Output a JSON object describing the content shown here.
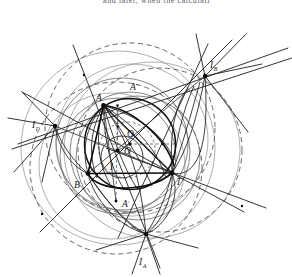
{
  "figure": {
    "title_strip": "and later, when the calculati",
    "canvas": {
      "width": 292,
      "height": 277,
      "background": "#ffffff"
    },
    "stroke_colors": {
      "heavy": "#111111",
      "medium": "#3a3a3a",
      "light": "#6e6e6e",
      "faint": "#8d8d8d",
      "dashed": "#4a4a4a"
    },
    "labels": [
      {
        "name": "vertex-a",
        "text": "A",
        "sub": "",
        "x": 96,
        "y": 101
      },
      {
        "name": "vertex-b",
        "text": "B",
        "sub": "",
        "x": 74,
        "y": 188
      },
      {
        "name": "vertex-gamma",
        "text": "Γ",
        "sub": "",
        "x": 177,
        "y": 185
      },
      {
        "name": "point-a-double",
        "text": "A",
        "sub": "″",
        "x": 130,
        "y": 90
      },
      {
        "name": "point-a-prime",
        "text": "A",
        "sub": "′",
        "x": 122,
        "y": 207
      },
      {
        "name": "circumcenter-o",
        "text": "O",
        "sub": "",
        "x": 127,
        "y": 137
      },
      {
        "name": "point-o-prime",
        "text": "O",
        "sub": "′",
        "x": 124,
        "y": 154
      },
      {
        "name": "incenter-i",
        "text": "I",
        "sub": "",
        "x": 110,
        "y": 170
      },
      {
        "name": "excenter-i-gamma",
        "text": "I",
        "sub": "Γ",
        "x": 32,
        "y": 128
      },
      {
        "name": "excenter-i-b",
        "text": "I",
        "sub": "B",
        "x": 210,
        "y": 68
      },
      {
        "name": "excenter-i-a",
        "text": "I",
        "sub": "A",
        "x": 139,
        "y": 265
      }
    ],
    "points": {
      "A": {
        "x": 103.5,
        "y": 105.5
      },
      "B": {
        "x": 88.0,
        "y": 173.5
      },
      "Gamma": {
        "x": 172.0,
        "y": 173.0
      },
      "I": {
        "x": 117.5,
        "y": 150.5
      },
      "O": {
        "x": 130.0,
        "y": 144.0
      },
      "Aprime": {
        "x": 116.0,
        "y": 201.0
      },
      "Adouble": {
        "x": 117.5,
        "y": 105.5
      },
      "IA": {
        "x": 146.0,
        "y": 234.0
      },
      "IB": {
        "x": 205.0,
        "y": 76.0
      },
      "IGamma": {
        "x": 55.0,
        "y": 126.0
      },
      "M": {
        "x": 118.0,
        "y": 126.5
      }
    },
    "geometry_note": {
      "type": "euclidean-construction",
      "subject": "triangle with incircle, circumcircle, excircles and excenters",
      "triangle_vertices": [
        "A",
        "B",
        "Γ"
      ],
      "excenters": [
        "I_A",
        "I_B",
        "I_Γ"
      ],
      "centers": [
        "I",
        "O",
        "O′"
      ]
    }
  }
}
